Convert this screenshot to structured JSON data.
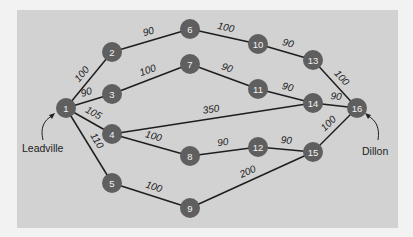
{
  "diagram": {
    "type": "network",
    "colors": {
      "background": "#f2f2f2",
      "panel": "#d2d2d2",
      "node": "#5f5f5f",
      "edge": "#1e1e1e"
    },
    "places": {
      "source": {
        "label": "Leadville",
        "node": "1"
      },
      "sink": {
        "label": "Dillon",
        "node": "16"
      }
    },
    "nodes": [
      {
        "id": "1",
        "x": 66,
        "y": 108
      },
      {
        "id": "2",
        "x": 112,
        "y": 52
      },
      {
        "id": "3",
        "x": 112,
        "y": 94
      },
      {
        "id": "4",
        "x": 112,
        "y": 134
      },
      {
        "id": "5",
        "x": 112,
        "y": 183
      },
      {
        "id": "6",
        "x": 190,
        "y": 29
      },
      {
        "id": "7",
        "x": 190,
        "y": 64
      },
      {
        "id": "8",
        "x": 190,
        "y": 156
      },
      {
        "id": "9",
        "x": 190,
        "y": 208
      },
      {
        "id": "10",
        "x": 258,
        "y": 44
      },
      {
        "id": "11",
        "x": 258,
        "y": 89
      },
      {
        "id": "12",
        "x": 258,
        "y": 147
      },
      {
        "id": "13",
        "x": 313,
        "y": 60
      },
      {
        "id": "14",
        "x": 313,
        "y": 103
      },
      {
        "id": "15",
        "x": 313,
        "y": 152
      },
      {
        "id": "16",
        "x": 357,
        "y": 108
      }
    ],
    "edges": [
      {
        "from": "1",
        "to": "2",
        "weight": "100"
      },
      {
        "from": "1",
        "to": "3",
        "weight": "90"
      },
      {
        "from": "1",
        "to": "4",
        "weight": "105"
      },
      {
        "from": "1",
        "to": "5",
        "weight": "110"
      },
      {
        "from": "2",
        "to": "6",
        "weight": "90"
      },
      {
        "from": "3",
        "to": "7",
        "weight": "100"
      },
      {
        "from": "4",
        "to": "14",
        "weight": "350"
      },
      {
        "from": "4",
        "to": "8",
        "weight": "100"
      },
      {
        "from": "5",
        "to": "9",
        "weight": "100"
      },
      {
        "from": "6",
        "to": "10",
        "weight": "100"
      },
      {
        "from": "7",
        "to": "11",
        "weight": "90"
      },
      {
        "from": "8",
        "to": "12",
        "weight": "90"
      },
      {
        "from": "9",
        "to": "15",
        "weight": "200"
      },
      {
        "from": "10",
        "to": "13",
        "weight": "90"
      },
      {
        "from": "11",
        "to": "14",
        "weight": "90"
      },
      {
        "from": "12",
        "to": "15",
        "weight": "90"
      },
      {
        "from": "13",
        "to": "16",
        "weight": "100"
      },
      {
        "from": "14",
        "to": "16",
        "weight": "90"
      },
      {
        "from": "15",
        "to": "16",
        "weight": "100"
      }
    ]
  }
}
